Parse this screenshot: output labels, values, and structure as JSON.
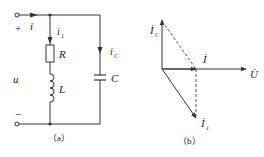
{
  "figure_a": {
    "caption": "（a）",
    "labels": {
      "plus": "+",
      "minus": "−",
      "current_i": "i",
      "current_i1": "i",
      "current_i1_sub": "1",
      "current_ic": "i",
      "current_ic_sub": "C",
      "voltage_u": "u",
      "resistor": "R",
      "inductor": "L",
      "capacitor": "C"
    }
  },
  "figure_b": {
    "caption": "（b）",
    "labels": {
      "ic_phasor": "İ",
      "ic_sub": "C",
      "i_phasor": "İ",
      "i1_phasor": "İ",
      "i1_sub": "1",
      "u_phasor": "U̇"
    }
  },
  "colors": {
    "line": "#333333",
    "background": "#ffffff"
  }
}
